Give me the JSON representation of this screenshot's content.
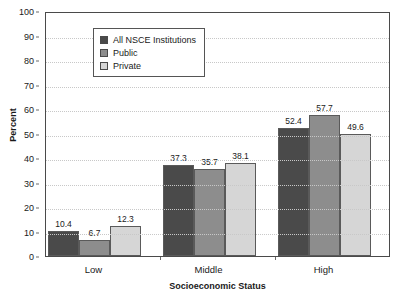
{
  "chart_data": {
    "type": "bar",
    "title": "",
    "xlabel": "Socioeconomic Status",
    "ylabel": "Percent",
    "categories": [
      "Low",
      "Middle",
      "High"
    ],
    "series": [
      {
        "name": "All NSCE Institutions",
        "values": [
          10.4,
          37.3,
          52.4
        ],
        "color": "#4a4a4a"
      },
      {
        "name": "Public",
        "values": [
          6.7,
          35.7,
          57.7
        ],
        "color": "#8d8d8d"
      },
      {
        "name": "Private",
        "values": [
          12.3,
          38.1,
          49.6
        ],
        "color": "#d6d6d6"
      }
    ],
    "ylim": [
      0,
      100
    ],
    "yticks": [
      0,
      10,
      20,
      30,
      40,
      50,
      60,
      70,
      80,
      90,
      100
    ],
    "ytick_labels": [
      "0",
      "10",
      "20",
      "30",
      "40",
      "50",
      "60",
      "70",
      "80",
      "90",
      "100"
    ],
    "grid": true,
    "grid_color": "#c8c8c8",
    "legend_position": "top-left-inside",
    "data_labels": [
      [
        "10.4",
        "6.7",
        "12.3"
      ],
      [
        "37.3",
        "35.7",
        "38.1"
      ],
      [
        "52.4",
        "57.7",
        "49.6"
      ]
    ],
    "axis_color": "#4a4a4a",
    "background": "#ffffff"
  }
}
